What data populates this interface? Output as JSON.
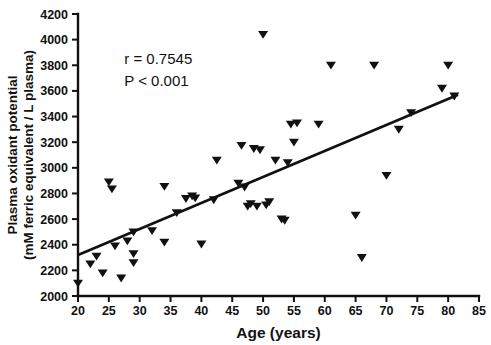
{
  "chart_data": {
    "type": "scatter",
    "title": "",
    "xlabel": "Age (years)",
    "ylabel": "Plasma oxidant potential (mM ferric equivalent / L plasma)",
    "ylabel_lines": [
      "Plasma oxidant potential",
      "(mM ferric equivalent / L plasma)"
    ],
    "xlim": [
      20,
      85
    ],
    "ylim": [
      2000,
      4200
    ],
    "xticks": [
      20,
      25,
      30,
      35,
      40,
      45,
      50,
      55,
      60,
      65,
      70,
      75,
      80,
      85
    ],
    "yticks": [
      2000,
      2200,
      2400,
      2600,
      2800,
      3000,
      3200,
      3400,
      3600,
      3800,
      4000,
      4200
    ],
    "xtick_labels": [
      "20",
      "25",
      "30",
      "35",
      "40",
      "45",
      "50",
      "55",
      "60",
      "65",
      "70",
      "75",
      "80",
      "85"
    ],
    "ytick_labels": [
      "2000",
      "2200",
      "2400",
      "2600",
      "2800",
      "3000",
      "3200",
      "3400",
      "3600",
      "3800",
      "4000",
      "4200"
    ],
    "grid": false,
    "legend": false,
    "marker": "triangle-down",
    "marker_color": "#111111",
    "series": [
      {
        "name": "Subjects",
        "x": [
          20,
          22,
          23,
          24,
          25,
          25.5,
          26,
          27,
          28,
          29,
          29,
          29,
          32,
          34,
          34,
          36,
          37.5,
          38.5,
          39,
          40,
          42,
          42.5,
          46,
          46.5,
          47,
          47.5,
          48,
          48.5,
          49,
          49.5,
          50,
          50.5,
          51,
          52,
          53,
          53.5,
          54,
          54.5,
          55,
          55.5,
          59,
          61,
          65,
          66,
          68,
          70,
          72,
          74,
          79,
          80,
          81
        ],
        "y": [
          2100,
          2250,
          2310,
          2180,
          2890,
          2835,
          2390,
          2140,
          2430,
          2500,
          2330,
          2260,
          2510,
          2855,
          2420,
          2650,
          2760,
          2780,
          2765,
          2405,
          2750,
          3060,
          2880,
          3175,
          2850,
          2700,
          2720,
          3150,
          2700,
          3140,
          4040,
          2710,
          2735,
          3060,
          2600,
          2590,
          3040,
          3340,
          3200,
          3350,
          3340,
          3800,
          2630,
          2300,
          3800,
          2940,
          3300,
          3430,
          3620,
          3800,
          3560
        ]
      }
    ],
    "fit_line": {
      "name": "linear-regression",
      "x_start": 20,
      "x_end": 81.6,
      "y_start": 2320,
      "y_end": 3570
    },
    "annotations": [
      {
        "name": "correlation",
        "text": "r = 0.7545",
        "x": 27.5,
        "y": 3810
      },
      {
        "name": "p-value",
        "text": "P < 0.001",
        "x": 27.5,
        "y": 3640
      }
    ]
  }
}
